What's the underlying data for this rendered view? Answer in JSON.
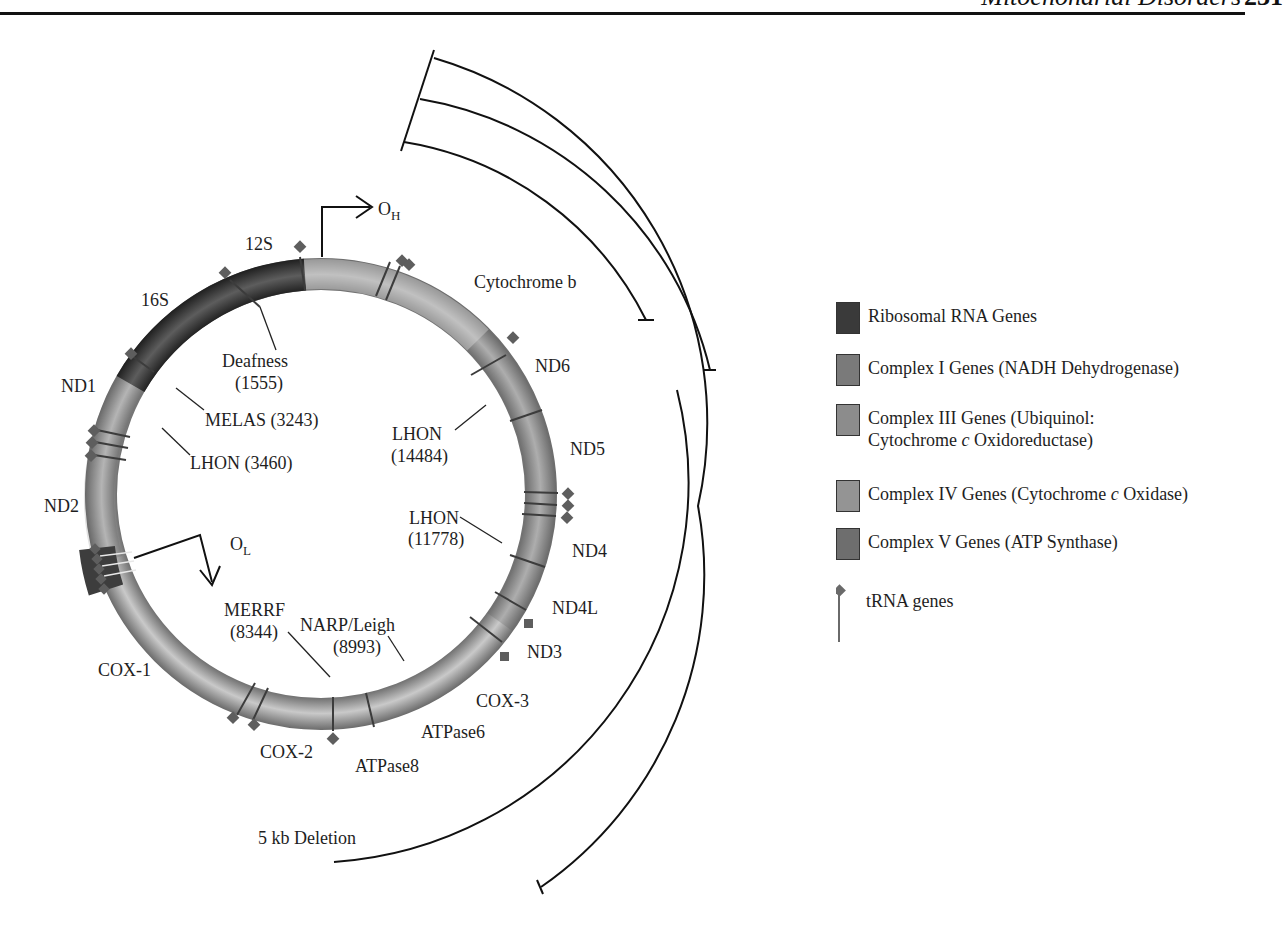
{
  "header": {
    "running_title": "Mitochondrial Disorders",
    "page_number": "231"
  },
  "diagram": {
    "origins": {
      "heavy": {
        "label": "O",
        "subscript": "H"
      },
      "light": {
        "label": "O",
        "subscript": "L"
      }
    },
    "genes": [
      {
        "label": "12S",
        "class": "ribosomal"
      },
      {
        "label": "16S",
        "class": "ribosomal"
      },
      {
        "label": "ND1",
        "class": "complex1"
      },
      {
        "label": "ND2",
        "class": "complex1"
      },
      {
        "label": "COX-1",
        "class": "complex4"
      },
      {
        "label": "COX-2",
        "class": "complex4"
      },
      {
        "label": "ATPase8",
        "class": "complex5"
      },
      {
        "label": "ATPase6",
        "class": "complex5"
      },
      {
        "label": "COX-3",
        "class": "complex4"
      },
      {
        "label": "ND3",
        "class": "complex1"
      },
      {
        "label": "ND4L",
        "class": "complex1"
      },
      {
        "label": "ND4",
        "class": "complex1"
      },
      {
        "label": "ND5",
        "class": "complex1"
      },
      {
        "label": "ND6",
        "class": "complex1"
      },
      {
        "label": "Cytochrome b",
        "class": "complex3"
      }
    ],
    "mutations": [
      {
        "name": "Deafness",
        "position": "(1555)"
      },
      {
        "name": "MELAS (3243)",
        "position": ""
      },
      {
        "name": "LHON (3460)",
        "position": ""
      },
      {
        "name": "MERRF",
        "position": "(8344)"
      },
      {
        "name": "NARP/Leigh",
        "position": "(8993)"
      },
      {
        "name": "LHON",
        "position": "(11778)"
      },
      {
        "name": "LHON",
        "position": "(14484)"
      }
    ],
    "deletion_label": "5 kb Deletion"
  },
  "legend": {
    "items": [
      {
        "label": "Ribosomal RNA Genes",
        "color": "#3a3a3a"
      },
      {
        "label": "Complex I Genes (NADH Dehydrogenase)",
        "color": "#7a7a7a"
      },
      {
        "label_line1": "Complex III Genes (Ubiquinol:",
        "label_line2_pre": "Cytochrome ",
        "label_line2_ital": "c",
        "label_line2_post": " Oxidoreductase)",
        "color": "#8c8c8c"
      },
      {
        "label_pre": "Complex IV Genes (Cytochrome ",
        "label_ital": "c",
        "label_post": " Oxidase)",
        "color": "#949494"
      },
      {
        "label": "Complex V Genes (ATP Synthase)",
        "color": "#6e6e6e"
      },
      {
        "label": "tRNA genes",
        "color": "#6a6a6a"
      }
    ]
  },
  "colors": {
    "ribosomal": "#3a3a3a",
    "complex1": "#8a8a8a",
    "complex3": "#b4b4b4",
    "complex4": "#a0a0a0",
    "complex5": "#9a9a9a",
    "trna": "#5e5e5e",
    "line": "#111111"
  }
}
